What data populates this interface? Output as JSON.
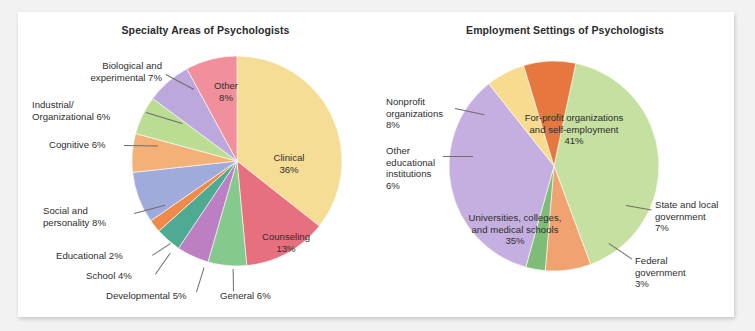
{
  "figure": {
    "background_color": "#f2f2f2",
    "panel_color": "#ffffff"
  },
  "chart_data": [
    {
      "type": "pie",
      "title": "Specialty Areas of Psychologists",
      "xlabel": "",
      "ylabel": "",
      "legend": "none",
      "grid": false,
      "categories": [
        "Clinical",
        "Counseling",
        "General",
        "Developmental",
        "School",
        "Educational",
        "Social and personality",
        "Cognitive",
        "Industrial/Organizational",
        "Biological and experimental",
        "Other"
      ],
      "values": [
        36,
        13,
        6,
        5,
        4,
        2,
        8,
        6,
        6,
        7,
        8
      ],
      "unit": "%",
      "colors": [
        "#f6dd95",
        "#e6707e",
        "#86c98c",
        "#bd7fc4",
        "#4eab92",
        "#ef8a4b",
        "#9fabdb",
        "#f3b178",
        "#bbdc93",
        "#bda8dd",
        "#f1909c"
      ],
      "labels": [
        {
          "text": "Clinical\n36%",
          "placement": "inside"
        },
        {
          "text": "Counseling\n13%",
          "placement": "inside"
        },
        {
          "text": "General 6%",
          "placement": "callout"
        },
        {
          "text": "Developmental 5%",
          "placement": "callout"
        },
        {
          "text": "School 4%",
          "placement": "callout"
        },
        {
          "text": "Educational 2%",
          "placement": "callout"
        },
        {
          "text": "Social and\npersonality 8%",
          "placement": "callout"
        },
        {
          "text": "Cognitive 6%",
          "placement": "callout"
        },
        {
          "text": "Industrial/\nOrganizational 6%",
          "placement": "callout"
        },
        {
          "text": "Biological and\nexperimental 7%",
          "placement": "callout"
        },
        {
          "text": "Other\n8%",
          "placement": "inside"
        }
      ]
    },
    {
      "type": "pie",
      "title": "Employment Settings of Psychologists",
      "xlabel": "",
      "ylabel": "",
      "legend": "none",
      "grid": false,
      "categories": [
        "For-profit organizations and self-employment",
        "State and local government",
        "Federal government",
        "Universities, colleges, and medical schools",
        "Other educational institutions",
        "Nonprofit organizations"
      ],
      "values": [
        41,
        7,
        3,
        35,
        6,
        8
      ],
      "unit": "%",
      "colors": [
        "#c5e0a0",
        "#f0a271",
        "#7fbc78",
        "#c5aee0",
        "#f7dc8f",
        "#e5773f"
      ],
      "labels": [
        {
          "text": "For-profit organizations\nand self-employment\n41%",
          "placement": "inside"
        },
        {
          "text": "State and local\ngovernment\n7%",
          "placement": "callout"
        },
        {
          "text": "Federal\ngovernment\n3%",
          "placement": "callout"
        },
        {
          "text": "Universities, colleges,\nand medical schools\n35%",
          "placement": "inside"
        },
        {
          "text": "Other\neducational\ninstitutions\n6%",
          "placement": "callout"
        },
        {
          "text": "Nonprofit\norganizations\n8%",
          "placement": "callout"
        }
      ]
    }
  ],
  "left_chart": {
    "title": "Specialty Areas of Psychologists",
    "inside_labels": {
      "clinical": "Clinical\n36%",
      "counseling": "Counseling\n13%",
      "other": "Other\n8%"
    },
    "callouts": {
      "biological": "Biological and\nexperimental 7%",
      "industrial": "Industrial/\nOrganizational 6%",
      "cognitive": "Cognitive 6%",
      "social": "Social and\npersonality 8%",
      "educational": "Educational 2%",
      "school": "School 4%",
      "developmental": "Developmental 5%",
      "general": "General 6%"
    }
  },
  "right_chart": {
    "title": "Employment Settings of Psychologists",
    "inside_labels": {
      "for_profit": "For-profit organizations\nand self-employment\n41%",
      "universities": "Universities, colleges,\nand medical schools\n35%"
    },
    "callouts": {
      "nonprofit": "Nonprofit\norganizations\n8%",
      "other_educational": "Other\neducational\ninstitutions\n6%",
      "state_local": "State and local\ngovernment\n7%",
      "federal": "Federal\ngovernment\n3%"
    }
  }
}
